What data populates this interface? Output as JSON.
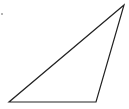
{
  "diagram": {
    "type": "triangle",
    "stroke_color": "#222222",
    "background": "#ffffff",
    "stroke_width": 1.2,
    "vertices": [
      {
        "name": "apex",
        "x": 124,
        "y": 5
      },
      {
        "name": "bottom-left",
        "x": 9,
        "y": 102
      },
      {
        "name": "bottom-right",
        "x": 96,
        "y": 102
      }
    ],
    "points": "124,5 9,102 96,102",
    "marker": {
      "x": 2,
      "y": 14,
      "r": 0.8,
      "color": "#555555"
    }
  }
}
